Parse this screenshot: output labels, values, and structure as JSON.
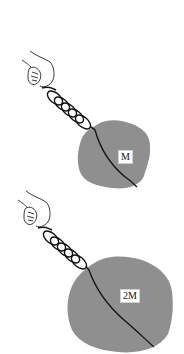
{
  "diagram": {
    "colors": {
      "mass_fill": "#8f8f8f",
      "line": "#111111",
      "background": "#ffffff"
    },
    "figures": [
      {
        "id": "top",
        "mass_label": "M",
        "icons": [
          "hand-icon",
          "spring-icon",
          "mass-blob-icon"
        ]
      },
      {
        "id": "bottom",
        "mass_label": "2M",
        "icons": [
          "hand-icon",
          "spring-icon",
          "mass-blob-icon"
        ]
      }
    ]
  }
}
